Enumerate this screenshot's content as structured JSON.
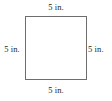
{
  "figure": {
    "type": "square-diagram",
    "shape_name": "square",
    "stroke_color": "#6e6e6e",
    "fill_color": "#ffffff",
    "text_color": "#231f20",
    "labels": {
      "top": "5 in.",
      "right": "5 in.",
      "bottom": "5 in.",
      "left": "5 in."
    }
  }
}
